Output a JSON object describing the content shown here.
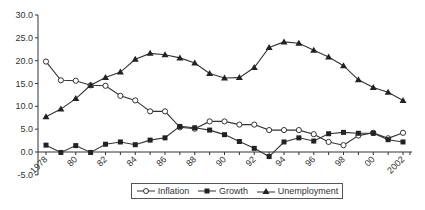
{
  "chart_data": {
    "type": "line",
    "title": "",
    "xlabel": "",
    "ylabel": "",
    "ylim": [
      -5.0,
      30.0
    ],
    "yticks": [
      "-5.0",
      "0.0",
      "5.0",
      "10.0",
      "15.0",
      "20.0",
      "25.0",
      "30.0"
    ],
    "xtick_labels": [
      "1978",
      "80",
      "82",
      "84",
      "86",
      "88",
      "90",
      "92",
      "94",
      "96",
      "98",
      "00",
      "2002"
    ],
    "grid": false,
    "legend_position": "bottom",
    "x": [
      1978,
      1979,
      1980,
      1981,
      1982,
      1983,
      1984,
      1985,
      1986,
      1987,
      1988,
      1989,
      1990,
      1991,
      1992,
      1993,
      1994,
      1995,
      1996,
      1997,
      1998,
      1999,
      2000,
      2001,
      2002
    ],
    "series": [
      {
        "name": "Inflation",
        "marker": "open-circle",
        "values": [
          19.8,
          15.7,
          15.6,
          14.6,
          14.5,
          12.3,
          11.3,
          8.9,
          8.9,
          5.4,
          5.1,
          6.7,
          6.7,
          6.0,
          6.0,
          4.8,
          4.8,
          4.8,
          3.9,
          2.2,
          1.5,
          3.6,
          4.2,
          3.0,
          4.2
        ]
      },
      {
        "name": "Growth",
        "marker": "filled-square",
        "values": [
          1.5,
          -0.1,
          1.4,
          -0.1,
          1.7,
          2.2,
          1.6,
          2.6,
          3.1,
          5.6,
          5.3,
          4.8,
          3.8,
          2.3,
          0.8,
          -1.0,
          2.2,
          3.1,
          2.4,
          4.0,
          4.3,
          4.1,
          4.1,
          2.7,
          2.2
        ]
      },
      {
        "name": "Unemployment",
        "marker": "filled-triangle",
        "values": [
          7.7,
          9.4,
          11.7,
          14.6,
          16.3,
          17.5,
          20.3,
          21.6,
          21.3,
          20.6,
          19.5,
          17.2,
          16.2,
          16.3,
          18.5,
          22.9,
          24.1,
          23.8,
          22.3,
          20.8,
          18.9,
          15.8,
          14.1,
          13.1,
          11.3
        ]
      }
    ]
  },
  "legend": {
    "items": [
      {
        "label": "Inflation"
      },
      {
        "label": "Growth"
      },
      {
        "label": "Unemployment"
      }
    ]
  },
  "colors": {
    "line": "#333333",
    "axis": "#333333",
    "marker_fill": "#222222",
    "open_marker_fill": "#ffffff"
  }
}
